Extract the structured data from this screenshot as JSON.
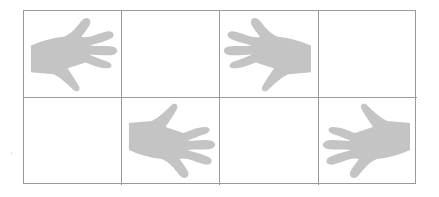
{
  "figure": {
    "layout": {
      "rows": 2,
      "columns": 4
    },
    "colors": {
      "hand_fill": "#c4c4c4",
      "grid_line": "#9a9a9a",
      "background": "#ffffff"
    },
    "cells": [
      {
        "row": 1,
        "col": 1,
        "content": "hand",
        "orientation": "wrist-left-thumb-down"
      },
      {
        "row": 1,
        "col": 2,
        "content": "empty"
      },
      {
        "row": 1,
        "col": 3,
        "content": "hand",
        "orientation": "wrist-right-thumb-down"
      },
      {
        "row": 1,
        "col": 4,
        "content": "empty"
      },
      {
        "row": 2,
        "col": 1,
        "content": "empty"
      },
      {
        "row": 2,
        "col": 2,
        "content": "hand",
        "orientation": "wrist-left-thumb-up"
      },
      {
        "row": 2,
        "col": 3,
        "content": "empty"
      },
      {
        "row": 2,
        "col": 4,
        "content": "hand",
        "orientation": "wrist-right-thumb-up"
      }
    ],
    "icons": {
      "hand": "hand-icon"
    }
  }
}
